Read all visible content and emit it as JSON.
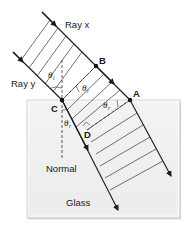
{
  "diagram": {
    "type": "refraction-wavefront",
    "labels": {
      "ray_x": "Ray x",
      "ray_y": "Ray y",
      "normal": "Normal",
      "medium": "Glass"
    },
    "points": {
      "A": "A",
      "B": "B",
      "C": "C",
      "D": "D"
    },
    "angles": {
      "incident_symbol": "θ",
      "incident_sub": "i",
      "refracted_symbol": "θ",
      "refracted_sub": "r"
    },
    "colors": {
      "glass_fill": "#f0f0f0",
      "glass_edge": "#d8d8d8",
      "line": "#1a1a1a",
      "dashed": "#333333"
    }
  }
}
